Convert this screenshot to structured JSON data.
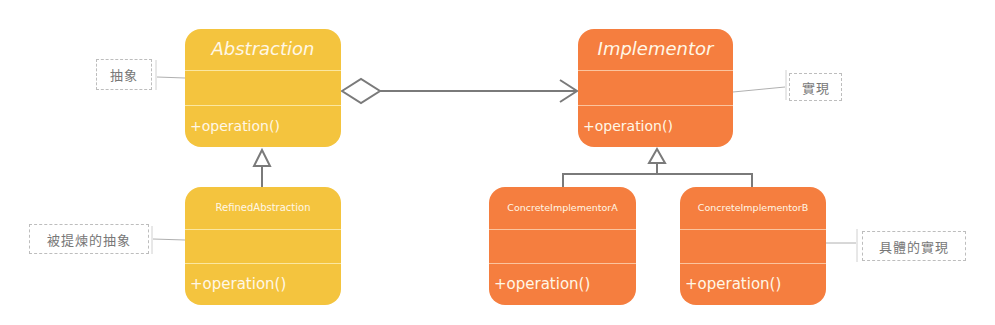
{
  "diagram": {
    "type": "UML class diagram (Bridge pattern)",
    "colors": {
      "abstraction_fill": "#f4c43e",
      "implementor_fill": "#f57e3f",
      "text_on_class": "#fff7e6",
      "connector": "#7a7a7a",
      "note_text": "#777777"
    },
    "classes": {
      "abstraction": {
        "name": "Abstraction",
        "operation": "+operation()"
      },
      "refined_abstraction": {
        "name": "RefinedAbstraction",
        "operation": "+operation()"
      },
      "implementor": {
        "name": "Implementor",
        "operation": "+operation()"
      },
      "concrete_a": {
        "name": "ConcreteImplementorA",
        "operation": "+operation()"
      },
      "concrete_b": {
        "name": "ConcreteImplementorB",
        "operation": "+operation()"
      }
    },
    "notes": {
      "abstraction": "抽象",
      "refined_abstraction": "被提煉的抽象",
      "implementor": "實現",
      "concrete": "具體的實現"
    },
    "relations": [
      {
        "from": "Abstraction",
        "to": "Implementor",
        "kind": "aggregation"
      },
      {
        "from": "RefinedAbstraction",
        "to": "Abstraction",
        "kind": "generalization"
      },
      {
        "from": "ConcreteImplementorA",
        "to": "Implementor",
        "kind": "generalization"
      },
      {
        "from": "ConcreteImplementorB",
        "to": "Implementor",
        "kind": "generalization"
      }
    ]
  }
}
